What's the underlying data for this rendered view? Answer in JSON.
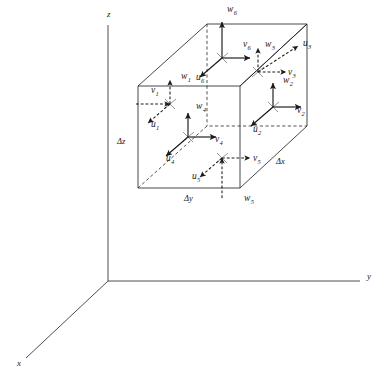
{
  "figure": {
    "axes": [
      {
        "name": "z-axis",
        "label": "z",
        "label_x": 107,
        "label_y": 17,
        "x1": 108,
        "y1": 25,
        "x2": 108,
        "y2": 281
      },
      {
        "name": "y-axis",
        "label": "y",
        "label_x": 367,
        "label_y": 279,
        "x1": 108,
        "y1": 281,
        "x2": 360,
        "y2": 281
      },
      {
        "name": "x-axis",
        "label": "x",
        "label_x": 17,
        "label_y": 366,
        "x1": 108,
        "y1": 281,
        "x2": 26,
        "y2": 358
      }
    ],
    "dimension_labels": [
      {
        "name": "delta-z",
        "text": "Δz",
        "x": 117,
        "y": 144
      },
      {
        "name": "delta-y",
        "text": "Δy",
        "x": 184,
        "y": 201
      },
      {
        "name": "delta-x",
        "text": "Δx",
        "x": 276,
        "y": 164
      }
    ],
    "cube": {
      "front_bottom_left": {
        "x": 138,
        "y": 188
      },
      "front_bottom_right": {
        "x": 240,
        "y": 188
      },
      "front_top_right": {
        "x": 240,
        "y": 86
      },
      "front_top_left": {
        "x": 138,
        "y": 86
      },
      "back_bottom_left": {
        "x": 207,
        "y": 126
      },
      "back_bottom_right": {
        "x": 307,
        "y": 126
      },
      "back_top_right": {
        "x": 307,
        "y": 24
      },
      "back_top_left": {
        "x": 207,
        "y": 24
      }
    },
    "nodes": [
      {
        "name": "node-1",
        "face": "left",
        "style": "dashed",
        "cx": 170,
        "cy": 104,
        "components": [
          {
            "name": "w1",
            "symbol": "w",
            "subscript": "1",
            "direction": "up",
            "label_x": 181,
            "label_y": 79
          },
          {
            "name": "v1",
            "symbol": "v",
            "subscript": "1",
            "direction": "right-in",
            "label_x": 151,
            "label_y": 93
          },
          {
            "name": "u1",
            "symbol": "u",
            "subscript": "1",
            "direction": "down-left",
            "label_x": 151,
            "label_y": 127
          }
        ]
      },
      {
        "name": "node-2",
        "face": "right",
        "style": "solid",
        "cx": 273,
        "cy": 107,
        "components": [
          {
            "name": "w2",
            "symbol": "w",
            "subscript": "2",
            "direction": "up",
            "label_x": 283,
            "label_y": 83
          },
          {
            "name": "v2",
            "symbol": "v",
            "subscript": "2",
            "direction": "right",
            "label_x": 297,
            "label_y": 113
          },
          {
            "name": "u2",
            "symbol": "u",
            "subscript": "2",
            "direction": "down-left",
            "label_x": 253,
            "label_y": 132
          }
        ]
      },
      {
        "name": "node-3",
        "face": "back",
        "style": "dashed",
        "cx": 258,
        "cy": 72,
        "components": [
          {
            "name": "w3",
            "symbol": "w",
            "subscript": "3",
            "direction": "up",
            "label_x": 265,
            "label_y": 47
          },
          {
            "name": "v3",
            "symbol": "v",
            "subscript": "3",
            "direction": "right",
            "label_x": 288,
            "label_y": 75
          },
          {
            "name": "u3",
            "symbol": "u",
            "subscript": "3",
            "direction": "up-right",
            "label_x": 303,
            "label_y": 46
          }
        ]
      },
      {
        "name": "node-4",
        "face": "front",
        "style": "solid",
        "cx": 188,
        "cy": 137,
        "components": [
          {
            "name": "w4",
            "symbol": "w",
            "subscript": "4",
            "direction": "up",
            "label_x": 196,
            "label_y": 109
          },
          {
            "name": "v4",
            "symbol": "v",
            "subscript": "4",
            "direction": "right",
            "label_x": 215,
            "label_y": 142
          },
          {
            "name": "u4",
            "symbol": "u",
            "subscript": "4",
            "direction": "down-left",
            "label_x": 166,
            "label_y": 161
          }
        ]
      },
      {
        "name": "node-5",
        "face": "bottom",
        "style": "dashed",
        "cx": 222,
        "cy": 158,
        "components": [
          {
            "name": "w5",
            "symbol": "w",
            "subscript": "5",
            "direction": "up-in",
            "label_x": 244,
            "label_y": 201
          },
          {
            "name": "v5",
            "symbol": "v",
            "subscript": "5",
            "direction": "right",
            "label_x": 253,
            "label_y": 161
          },
          {
            "name": "u5",
            "symbol": "u",
            "subscript": "5",
            "direction": "down-left",
            "label_x": 192,
            "label_y": 179
          }
        ]
      },
      {
        "name": "node-6",
        "face": "top",
        "style": "solid",
        "cx": 222,
        "cy": 58,
        "components": [
          {
            "name": "w6",
            "symbol": "w",
            "subscript": "6",
            "direction": "up-long",
            "label_x": 227,
            "label_y": 12
          },
          {
            "name": "v6",
            "symbol": "v",
            "subscript": "6",
            "direction": "right",
            "label_x": 243,
            "label_y": 47
          },
          {
            "name": "u6",
            "symbol": "u",
            "subscript": "6",
            "direction": "down-left",
            "label_x": 196,
            "label_y": 80
          }
        ]
      }
    ]
  }
}
